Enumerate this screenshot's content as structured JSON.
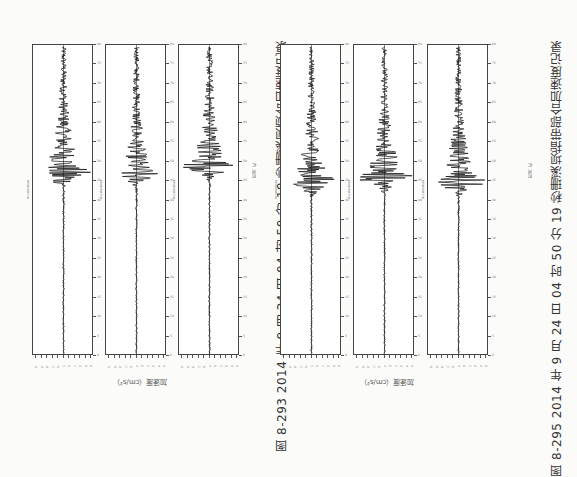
{
  "figures": [
    {
      "caption": "图 8-293   2014 年 9 月 24 日 04 时 50 分 19 秒珊溪坝顶合加速度记录",
      "ylabel": "加速度（cm/s²）",
      "xlabel": "时间（s）"
    },
    {
      "caption": "图 8-295   2014 年 9 月 24 日 04 时 50 分 19 秒珊溪坝指带部合加速度记录",
      "ylabel": "加速度（cm/s²）",
      "xlabel": "时间（s）"
    }
  ],
  "panel_header": "Acceleration",
  "chart_data": [
    {
      "type": "line",
      "title": "图 8-293 panel 1 (坝顶)",
      "xlabel": "时间（s）",
      "ylabel": "加速度（cm/s²）",
      "xlim": [
        0,
        80
      ],
      "series": [
        {
          "name": "Acceleration",
          "peak_time_s": 47,
          "peak_rel": 1.0
        }
      ]
    },
    {
      "type": "line",
      "title": "图 8-293 panel 2 (坝顶)",
      "xlabel": "时间（s）",
      "ylabel": "加速度（cm/s²）",
      "xlim": [
        0,
        80
      ],
      "series": [
        {
          "name": "Acceleration",
          "peak_time_s": 47,
          "peak_rel": 0.75
        }
      ]
    },
    {
      "type": "line",
      "title": "图 8-293 panel 3 (坝顶)",
      "xlabel": "时间（s）",
      "ylabel": "加速度（cm/s²）",
      "xlim": [
        0,
        80
      ],
      "series": [
        {
          "name": "Acceleration",
          "peak_time_s": 49,
          "peak_rel": 0.95
        }
      ]
    },
    {
      "type": "line",
      "title": "图 8-295 panel 1 (指带部)",
      "xlabel": "时间（s）",
      "ylabel": "加速度（cm/s²）",
      "xlim": [
        0,
        80
      ],
      "series": [
        {
          "name": "Acceleration",
          "peak_time_s": 45,
          "peak_rel": 0.9
        }
      ]
    },
    {
      "type": "line",
      "title": "图 8-295 panel 2 (指带部)",
      "xlabel": "时间（s）",
      "ylabel": "加速度（cm/s²）",
      "xlim": [
        0,
        80
      ],
      "series": [
        {
          "name": "Acceleration",
          "peak_time_s": 46,
          "peak_rel": 1.0
        }
      ]
    },
    {
      "type": "line",
      "title": "图 8-295 panel 3 (指带部)",
      "xlabel": "时间（s）",
      "ylabel": "加速度（cm/s²）",
      "xlim": [
        0,
        80
      ],
      "series": [
        {
          "name": "Acceleration",
          "peak_time_s": 45,
          "peak_rel": 0.95
        }
      ]
    }
  ],
  "time_ticks": [
    0,
    5,
    10,
    15,
    20,
    25,
    30,
    35,
    40,
    45,
    50,
    55,
    60,
    65,
    70,
    75,
    80
  ],
  "amp_ticks": [
    "-5",
    "-4",
    "-3",
    "-2",
    "-1",
    "0",
    "1",
    "2",
    "3",
    "4",
    "5"
  ],
  "panels_x": [
    32,
    105,
    178,
    280,
    353,
    427
  ],
  "panel_width": 61
}
